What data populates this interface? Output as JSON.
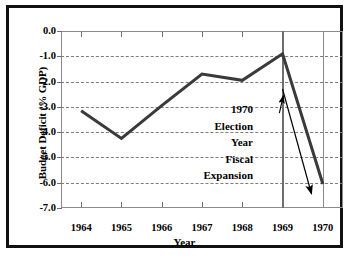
{
  "chart_data": {
    "type": "line",
    "title": "",
    "subtitle": "",
    "xlabel": "Year",
    "ylabel": "Budget Deficit (% GDP)",
    "x": [
      1964,
      1965,
      1966,
      1967,
      1968,
      1969,
      1970
    ],
    "categories": [
      "1964",
      "1965",
      "1966",
      "1967",
      "1968",
      "1969",
      "1970"
    ],
    "values": [
      -3.15,
      -4.25,
      -2.95,
      -1.7,
      -1.95,
      -0.9,
      -6.05
    ],
    "series": [
      {
        "name": "Budget Deficit (% GDP)",
        "values": [
          -3.15,
          -4.25,
          -2.95,
          -1.7,
          -1.95,
          -0.9,
          -6.05
        ]
      }
    ],
    "xlim": [
      1963.5,
      1970.5
    ],
    "ylim": [
      -7.0,
      0.0
    ],
    "yticks": [
      0.0,
      -1.0,
      -2.0,
      -3.0,
      -4.0,
      -5.0,
      -6.0,
      -7.0
    ],
    "ytick_labels": [
      "0.0",
      "-1.0",
      "-2.0",
      "-3.0",
      "-4.0",
      "-5.0",
      "-6.0",
      "-7.0"
    ],
    "xticks": [
      1964,
      1965,
      1966,
      1967,
      1968,
      1969,
      1970
    ],
    "xtick_labels": [
      "1964",
      "1965",
      "1966",
      "1967",
      "1968",
      "1969",
      "1970"
    ],
    "grid": "horizontal-dashed",
    "legend": "none",
    "line_color": "#3a3a3a",
    "line_width": 3,
    "annotations": [
      {
        "text_lines": [
          "1970",
          "Election",
          "Year",
          "Fiscal",
          "Expansion"
        ],
        "align": "right",
        "leader_arrow": {
          "from_x": 1968.92,
          "from_y": -3.25,
          "to_x": 1969.02,
          "to_y": -2.55
        },
        "trend_arrow": {
          "from_x": 1969.0,
          "from_y": -2.3,
          "to_x": 1969.72,
          "to_y": -6.45
        }
      }
    ],
    "vertical_reference_lines": [
      {
        "x": 1969,
        "style": "thick",
        "color": "#6f6f6f"
      },
      {
        "x": 1970,
        "style": "thin",
        "color": "#8a8a8a"
      }
    ]
  },
  "figure": {
    "border_color": "#111111",
    "background": "#ffffff",
    "axis_color": "#8c8c8c",
    "grid_color": "#7d7d7d"
  }
}
